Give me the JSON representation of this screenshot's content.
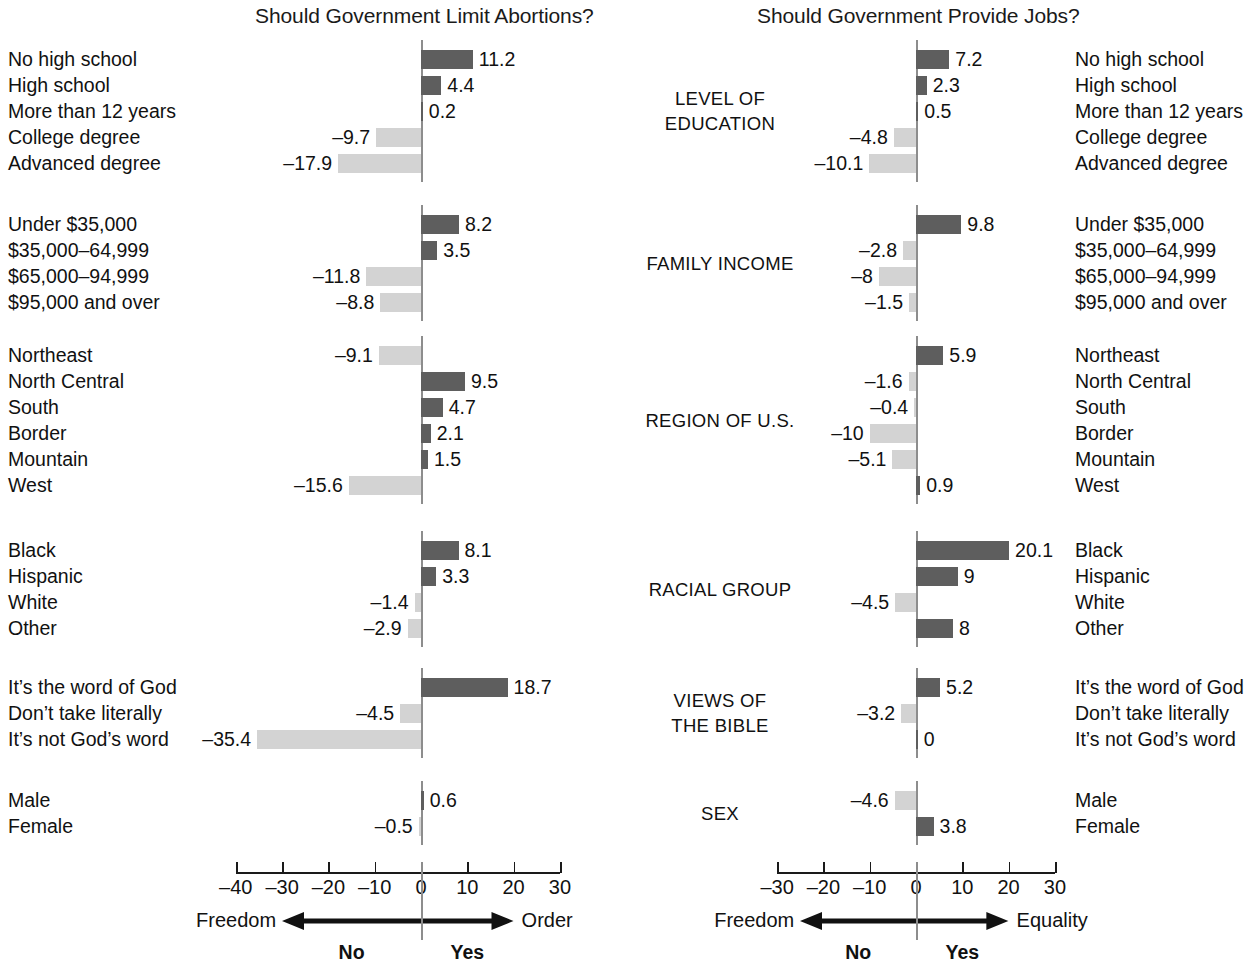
{
  "titles": {
    "left": "Should Government Limit Abortions?",
    "right": "Should Government Provide Jobs?"
  },
  "axis": {
    "left": {
      "ticks": [
        "–40",
        "–30",
        "–20",
        "–10",
        "0",
        "10",
        "20",
        "30"
      ],
      "tick_values": [
        -40,
        -30,
        -20,
        -10,
        0,
        10,
        20,
        30
      ],
      "range": [
        -40,
        30
      ]
    },
    "right": {
      "ticks": [
        "–30",
        "–20",
        "–10",
        "0",
        "10",
        "20",
        "30"
      ],
      "tick_values": [
        -30,
        -20,
        -10,
        0,
        10,
        20,
        30
      ],
      "range": [
        -30,
        30
      ]
    }
  },
  "legend": {
    "left": {
      "neg_word": "Freedom",
      "pos_word": "Order",
      "neg_answer": "No",
      "pos_answer": "Yes"
    },
    "right": {
      "neg_word": "Freedom",
      "pos_word": "Equality",
      "neg_answer": "No",
      "pos_answer": "Yes"
    }
  },
  "colors": {
    "positive_bar": "#5e5e5e",
    "negative_bar": "#d3d3d3",
    "zero_rule": "#8d8d8d",
    "text": "#111111"
  },
  "groups": [
    {
      "heading": "LEVEL OF\nEDUCATION",
      "categories": [
        "No high school",
        "High school",
        "More than 12 years",
        "College degree",
        "Advanced degree"
      ],
      "left_values": [
        11.2,
        4.4,
        0.2,
        -9.7,
        -17.9
      ],
      "right_values": [
        7.2,
        2.3,
        0.5,
        -4.8,
        -10.1
      ],
      "left_labels": [
        "11.2",
        "4.4",
        "0.2",
        "–9.7",
        "–17.9"
      ],
      "right_labels": [
        "7.2",
        "2.3",
        "0.5",
        "–4.8",
        "–10.1"
      ]
    },
    {
      "heading": "FAMILY INCOME",
      "categories": [
        "Under $35,000",
        "$35,000–64,999",
        "$65,000–94,999",
        "$95,000 and over"
      ],
      "left_values": [
        8.2,
        3.5,
        -11.8,
        -8.8
      ],
      "right_values": [
        9.8,
        -2.8,
        -8,
        -1.5
      ],
      "left_labels": [
        "8.2",
        "3.5",
        "–11.8",
        "–8.8"
      ],
      "right_labels": [
        "9.8",
        "–2.8",
        "–8",
        "–1.5"
      ]
    },
    {
      "heading": "REGION OF U.S.",
      "categories": [
        "Northeast",
        "North Central",
        "South",
        "Border",
        "Mountain",
        "West"
      ],
      "left_values": [
        -9.1,
        9.5,
        4.7,
        2.1,
        1.5,
        -15.6
      ],
      "right_values": [
        5.9,
        -1.6,
        -0.4,
        -10,
        -5.1,
        0.9
      ],
      "left_labels": [
        "–9.1",
        "9.5",
        "4.7",
        "2.1",
        "1.5",
        "–15.6"
      ],
      "right_labels": [
        "5.9",
        "–1.6",
        "–0.4",
        "–10",
        "–5.1",
        "0.9"
      ]
    },
    {
      "heading": "RACIAL GROUP",
      "categories": [
        "Black",
        "Hispanic",
        "White",
        "Other"
      ],
      "left_values": [
        8.1,
        3.3,
        -1.4,
        -2.9
      ],
      "right_values": [
        20.1,
        9,
        -4.5,
        8
      ],
      "left_labels": [
        "8.1",
        "3.3",
        "–1.4",
        "–2.9"
      ],
      "right_labels": [
        "20.1",
        "9",
        "–4.5",
        "8"
      ]
    },
    {
      "heading": "VIEWS OF\nTHE BIBLE",
      "categories": [
        "It’s the word of God",
        "Don’t take literally",
        "It’s not God’s word"
      ],
      "left_values": [
        18.7,
        -4.5,
        -35.4
      ],
      "right_values": [
        5.2,
        -3.2,
        0
      ],
      "left_labels": [
        "18.7",
        "–4.5",
        "–35.4"
      ],
      "right_labels": [
        "5.2",
        "–3.2",
        "0"
      ]
    },
    {
      "heading": "SEX",
      "categories": [
        "Male",
        "Female"
      ],
      "left_values": [
        0.6,
        -0.5
      ],
      "right_values": [
        -4.6,
        3.8
      ],
      "left_labels": [
        "0.6",
        "–0.5"
      ],
      "right_labels": [
        "–4.6",
        "3.8"
      ]
    }
  ],
  "chart_data": {
    "type": "bar",
    "xlabel": "",
    "ylabel": "",
    "grid": false,
    "orientation": "horizontal",
    "panels": [
      {
        "name": "Should Government Limit Abortions?",
        "xlim": [
          -40,
          30
        ],
        "xticks": [
          -40,
          -30,
          -20,
          -10,
          0,
          10,
          20,
          30
        ],
        "negative_direction_label": "Freedom",
        "positive_direction_label": "Order",
        "negative_answer": "No",
        "positive_answer": "Yes",
        "categories": [
          "No high school",
          "High school",
          "More than 12 years",
          "College degree",
          "Advanced degree",
          "Under $35,000",
          "$35,000–64,999",
          "$65,000–94,999",
          "$95,000 and over",
          "Northeast",
          "North Central",
          "South",
          "Border",
          "Mountain",
          "West",
          "Black",
          "Hispanic",
          "White",
          "Other",
          "It’s the word of God",
          "Don’t take literally",
          "It’s not God’s word",
          "Male",
          "Female"
        ],
        "values": [
          11.2,
          4.4,
          0.2,
          -9.7,
          -17.9,
          8.2,
          3.5,
          -11.8,
          -8.8,
          -9.1,
          9.5,
          4.7,
          2.1,
          1.5,
          -15.6,
          8.1,
          3.3,
          -1.4,
          -2.9,
          18.7,
          -4.5,
          -35.4,
          0.6,
          -0.5
        ]
      },
      {
        "name": "Should Government Provide Jobs?",
        "xlim": [
          -30,
          30
        ],
        "xticks": [
          -30,
          -20,
          -10,
          0,
          10,
          20,
          30
        ],
        "negative_direction_label": "Freedom",
        "positive_direction_label": "Equality",
        "negative_answer": "No",
        "positive_answer": "Yes",
        "categories": [
          "No high school",
          "High school",
          "More than 12 years",
          "College degree",
          "Advanced degree",
          "Under $35,000",
          "$35,000–64,999",
          "$65,000–94,999",
          "$95,000 and over",
          "Northeast",
          "North Central",
          "South",
          "Border",
          "Mountain",
          "West",
          "Black",
          "Hispanic",
          "White",
          "Other",
          "It’s the word of God",
          "Don’t take literally",
          "It’s not God’s word",
          "Male",
          "Female"
        ],
        "values": [
          7.2,
          2.3,
          0.5,
          -4.8,
          -10.1,
          9.8,
          -2.8,
          -8,
          -1.5,
          5.9,
          -1.6,
          -0.4,
          -10,
          -5.1,
          0.9,
          20.1,
          9,
          -4.5,
          8,
          5.2,
          -3.2,
          0,
          -4.6,
          3.8
        ]
      }
    ],
    "groups": [
      "LEVEL OF EDUCATION",
      "FAMILY INCOME",
      "REGION OF U.S.",
      "RACIAL GROUP",
      "VIEWS OF THE BIBLE",
      "SEX"
    ],
    "legend": [
      "positive = dark gray bar",
      "negative = light gray bar"
    ]
  }
}
